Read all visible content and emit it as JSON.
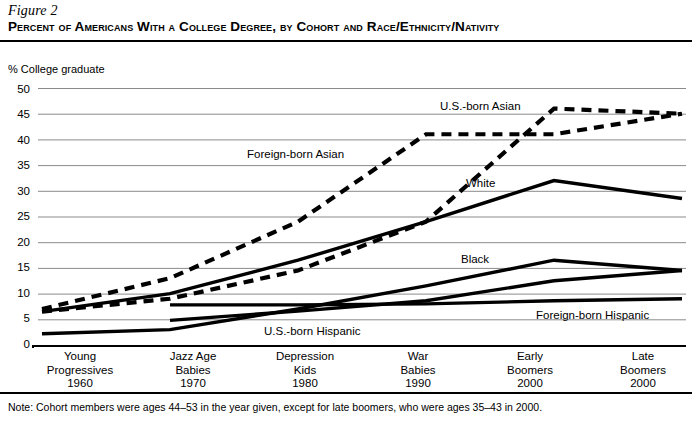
{
  "figure": {
    "number": "Figure 2",
    "title": "Percent of Americans With a College Degree, by Cohort and Race/Ethnicity/Nativity",
    "note": "Note: Cohort members were ages 44–53 in the year given, except for late boomers, who were ages 35–43 in 2000."
  },
  "axis": {
    "y_title": "% College graduate",
    "y_ticks": [
      "50",
      "45",
      "40",
      "35",
      "30",
      "25",
      "20",
      "15",
      "10",
      "5",
      "0"
    ]
  },
  "x_categories": [
    {
      "line1": "Young",
      "line2": "Progressives",
      "line3": "1960"
    },
    {
      "line1": "Jazz Age",
      "line2": "Babies",
      "line3": "1970"
    },
    {
      "line1": "Depression",
      "line2": "Kids",
      "line3": "1980"
    },
    {
      "line1": "War",
      "line2": "Babies",
      "line3": "1990"
    },
    {
      "line1": "Early",
      "line2": "Boomers",
      "line3": "2000"
    },
    {
      "line1": "Late",
      "line2": "Boomers",
      "line3": "2000"
    }
  ],
  "series_labels": {
    "us_born_asian": "U.S.-born Asian",
    "foreign_born_asian": "Foreign-born Asian",
    "white": "White",
    "black": "Black",
    "foreign_born_hispanic": "Foreign-born Hispanic",
    "us_born_hispanic": "U.S.-born Hispanic"
  },
  "colors": {
    "line": "#000000",
    "grid": "#8a8a8a",
    "background": "#ffffff"
  },
  "chart_data": {
    "type": "line",
    "title": "Percent of Americans With a College Degree, by Cohort and Race/Ethnicity/Nativity",
    "xlabel": "",
    "ylabel": "% College graduate",
    "ylim": [
      0,
      50
    ],
    "ytick_step": 5,
    "grid": true,
    "legend": "inline-labels",
    "categories": [
      "Young Progressives 1960",
      "Jazz Age Babies 1970",
      "Depression Kids 1980",
      "War Babies 1990",
      "Early Boomers 2000",
      "Late Boomers 2000"
    ],
    "series": [
      {
        "name": "Foreign-born Asian",
        "style": "dashed",
        "values": [
          7.0,
          13.0,
          24.0,
          41.0,
          41.0,
          45.0
        ]
      },
      {
        "name": "U.S.-born Asian",
        "style": "dashed",
        "values": [
          6.5,
          9.0,
          14.5,
          24.0,
          46.0,
          45.0
        ]
      },
      {
        "name": "White",
        "style": "solid",
        "values": [
          6.5,
          10.0,
          16.5,
          24.0,
          32.0,
          28.5
        ]
      },
      {
        "name": "Black",
        "style": "solid",
        "values": [
          2.2,
          3.0,
          7.0,
          11.5,
          16.5,
          14.5
        ]
      },
      {
        "name": "Foreign-born Hispanic",
        "style": "solid",
        "values": [
          null,
          7.8,
          7.8,
          8.0,
          8.6,
          9.0
        ]
      },
      {
        "name": "U.S.-born Hispanic",
        "style": "solid",
        "values": [
          null,
          4.8,
          6.6,
          8.6,
          12.5,
          14.5
        ]
      }
    ]
  }
}
